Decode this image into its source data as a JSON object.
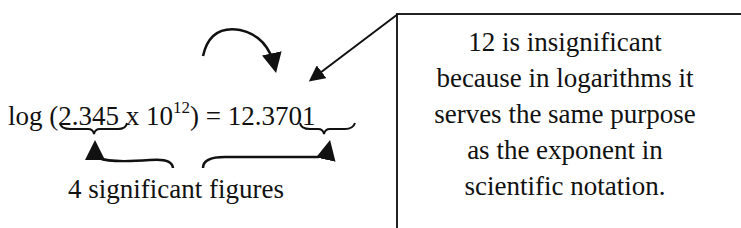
{
  "equation": {
    "prefix": "log (",
    "mantissa": "2.345",
    "times": " x 10",
    "exponent": "12",
    "close_equals": ") = ",
    "characteristic": "12",
    "decimal_point": ".",
    "result_mantissa": "3701"
  },
  "annotation": {
    "label": "4 significant figures"
  },
  "note": {
    "lines": [
      "12 is insignificant",
      "because in logarithms it",
      "serves the same purpose",
      "as the exponent in",
      "scientific notation."
    ]
  },
  "colors": {
    "ink": "#111111",
    "background": "#ffffff"
  }
}
